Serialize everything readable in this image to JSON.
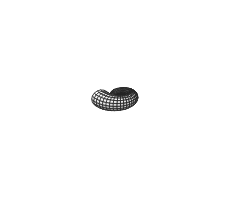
{
  "figure": {
    "caption": "3D logarithmic-spiral seashell surface rendered as a quadrilateral mesh with flat grayscale shading",
    "background": "#ffffff",
    "width": 252,
    "height": 200,
    "render_style": "flat-shaded quad mesh with black wireframe edges"
  },
  "geometry": {
    "surface_type": "logarithmic spiral tube",
    "spiral_center": {
      "x": 84,
      "y": 79
    },
    "turns": 2.42,
    "growth_per_turn": 3.05,
    "start_radius": 1.35,
    "tube_radius_ratio": 0.46,
    "u_segments": 104,
    "v_segments": 16,
    "tilt_deg": 26,
    "yaw_deg": -14,
    "scale": 1.0,
    "offset": {
      "x": 120,
      "y": 96
    }
  },
  "shading": {
    "light_direction": {
      "x": -0.42,
      "y": -0.72,
      "z": 0.55
    },
    "ambient": 0.42,
    "diffuse": 0.58,
    "min_gray": "#7d7d7d",
    "max_gray": "#fdfdfd",
    "palette": [
      "#808080",
      "#909090",
      "#a2a2a2",
      "#b4b4b4",
      "#c6c6c6",
      "#d8d8d8",
      "#e8e8e8",
      "#f4f4f4",
      "#fbfbfb"
    ]
  },
  "wireframe": {
    "edge_color": "#232323",
    "edge_width": 0.85,
    "silhouette_color": "#111111",
    "silhouette_width": 1.35
  },
  "chart_data": {
    "type": "surface",
    "xlabel": "",
    "ylabel": "",
    "grid": false,
    "legend": "none",
    "parametric_model": {
      "description": "Tube of circular cross-section swept along a logarithmic spiral, radius growing geometrically with polar angle",
      "equations": [
        "R(t) = r0 * k^t",
        "C(t) = (R(t)*cos(2*pi*t), R(t)*sin(2*pi*t), 0)",
        "S(t,v) = C(t) + rho*R(t) * (cos(v)*N(t) + sin(v)*Z)"
      ],
      "parameters": {
        "r0": 1.35,
        "k": 3.05,
        "rho": 0.46,
        "t_range": [
          0.0,
          2.42
        ],
        "v_range": [
          0.0,
          6.283185
        ]
      }
    },
    "mesh": {
      "u_divisions": 104,
      "v_divisions": 16,
      "visible_quads_estimate": 520,
      "face_shading": "flat lambertian, quantized to 9 gray levels"
    }
  }
}
